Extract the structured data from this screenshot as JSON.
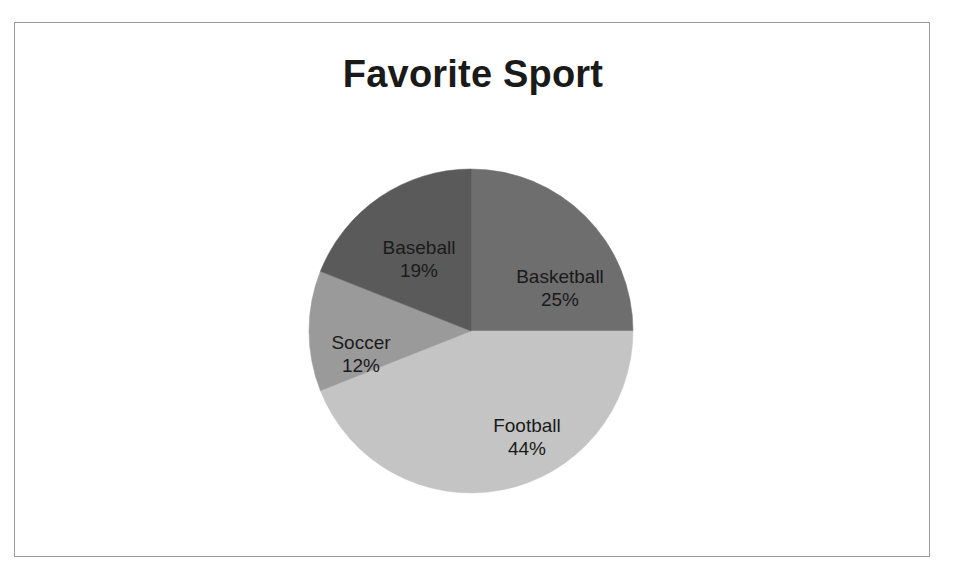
{
  "chart": {
    "title": "Favorite Sport"
  },
  "chart_data": {
    "type": "pie",
    "title": "Favorite Sport",
    "categories": [
      "Basketball",
      "Football",
      "Soccer",
      "Baseball"
    ],
    "values": [
      25,
      44,
      12,
      19
    ],
    "value_labels": [
      "25%",
      "44%",
      "12%",
      "19%"
    ],
    "unit": "percent",
    "legend": "none",
    "labels_position": "inside-slices",
    "start_angle_deg": 0,
    "direction": "clockwise",
    "colors": [
      "#6e6e6e",
      "#c4c4c4",
      "#9a9a9a",
      "#5a5a5a"
    ],
    "slices": [
      {
        "name": "Basketball",
        "value": 25,
        "value_label": "25%",
        "color": "#6e6e6e",
        "label_x": 545,
        "label_y": 265
      },
      {
        "name": "Football",
        "value": 44,
        "value_label": "44%",
        "color": "#c4c4c4",
        "label_x": 512,
        "label_y": 414
      },
      {
        "name": "Soccer",
        "value": 12,
        "value_label": "12%",
        "color": "#9a9a9a",
        "label_x": 346,
        "label_y": 331
      },
      {
        "name": "Baseball",
        "value": 19,
        "value_label": "19%",
        "color": "#5a5a5a",
        "label_x": 404,
        "label_y": 236
      }
    ],
    "geometry": {
      "center_x": 456,
      "center_y": 308,
      "radius": 162
    },
    "frame_color": "#9a9a9a",
    "background": "#ffffff",
    "title_color": "#1a1a1a",
    "label_color": "#1a1a1a"
  }
}
